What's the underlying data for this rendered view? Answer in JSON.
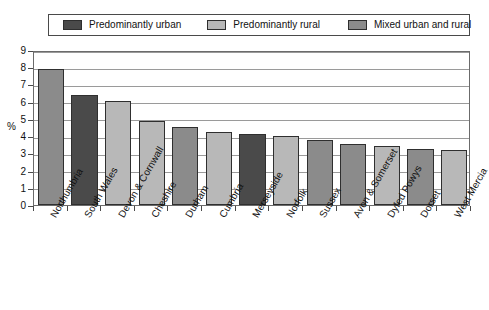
{
  "chart_data": {
    "type": "bar",
    "title": "",
    "xlabel": "",
    "ylabel": "%",
    "ylim": [
      0,
      9
    ],
    "ytick_labels": [
      "0",
      "1",
      "2",
      "3",
      "4",
      "5",
      "6",
      "7",
      "8",
      "9"
    ],
    "grid": true,
    "legend_position": "top",
    "categories": [
      "Northumbria",
      "South Wales",
      "Devon & Cornwall",
      "Cheshire",
      "Durham",
      "Cumbria",
      "Merseyside",
      "Norfolk",
      "Sussex",
      "Avon & Somerset",
      "Dyfed Powys",
      "Dorset",
      "West Mercia"
    ],
    "values": [
      7.9,
      6.4,
      6.05,
      4.9,
      4.55,
      4.25,
      4.15,
      4.0,
      3.75,
      3.55,
      3.45,
      3.25,
      3.2
    ],
    "point_categories": [
      "mixed",
      "urban",
      "rural",
      "rural",
      "mixed",
      "rural",
      "urban",
      "rural",
      "mixed",
      "mixed",
      "rural",
      "mixed",
      "rural"
    ],
    "series": [
      {
        "name": "Predominantly urban",
        "color": "#4a4a4a",
        "points": [
          {
            "category": "South Wales",
            "value": 6.4
          },
          {
            "category": "Merseyside",
            "value": 4.15
          }
        ]
      },
      {
        "name": "Predominantly rural",
        "color": "#b8b8b8",
        "points": [
          {
            "category": "Devon & Cornwall",
            "value": 6.05
          },
          {
            "category": "Cheshire",
            "value": 4.9
          },
          {
            "category": "Cumbria",
            "value": 4.25
          },
          {
            "category": "Norfolk",
            "value": 4.0
          },
          {
            "category": "Dyfed Powys",
            "value": 3.45
          },
          {
            "category": "West Mercia",
            "value": 3.2
          }
        ]
      },
      {
        "name": "Mixed urban and rural",
        "color": "#8b8b8b",
        "points": [
          {
            "category": "Northumbria",
            "value": 7.9
          },
          {
            "category": "Durham",
            "value": 4.55
          },
          {
            "category": "Sussex",
            "value": 3.75
          },
          {
            "category": "Avon & Somerset",
            "value": 3.55
          },
          {
            "category": "Dorset",
            "value": 3.25
          }
        ]
      }
    ]
  },
  "legend": {
    "items": [
      {
        "label": "Predominantly urban",
        "key": "urban",
        "color": "#4a4a4a"
      },
      {
        "label": "Predominantly rural",
        "key": "rural",
        "color": "#b8b8b8"
      },
      {
        "label": "Mixed urban and rural",
        "key": "mixed",
        "color": "#8b8b8b"
      }
    ]
  },
  "colors": {
    "urban": "#4a4a4a",
    "rural": "#b8b8b8",
    "mixed": "#8b8b8b",
    "bar_border": "#2f2f2f",
    "gridline": "#9a9a9a",
    "frame": "#6b6b6b",
    "text": "#111111",
    "background": "#ffffff"
  }
}
